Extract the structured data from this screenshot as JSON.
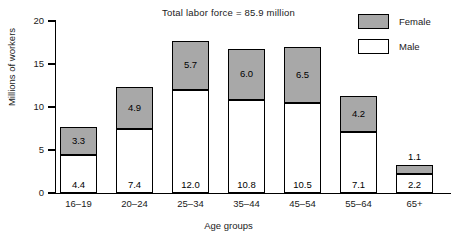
{
  "chart_data": {
    "type": "bar",
    "subtype": "stacked-bar",
    "title": "Total labor force = 85.9 million",
    "xlabel": "Age groups",
    "ylabel": "Millions of workers",
    "ylim": [
      0,
      20
    ],
    "yticks": [
      0,
      5,
      10,
      15,
      20
    ],
    "grid": false,
    "legend_position": "top-right",
    "categories": [
      "16–19",
      "20–24",
      "25–34",
      "35–44",
      "45–54",
      "55–64",
      "65+"
    ],
    "series": [
      {
        "name": "Male",
        "color": "#ffffff",
        "values": [
          4.4,
          7.4,
          12.0,
          10.8,
          10.5,
          7.1,
          2.2
        ],
        "labels": [
          "4.4",
          "7.4",
          "12.0",
          "10.8",
          "10.5",
          "7.1",
          "2.2"
        ]
      },
      {
        "name": "Female",
        "color": "#a8a8a8",
        "values": [
          3.3,
          4.9,
          5.7,
          6.0,
          6.5,
          4.2,
          1.1
        ],
        "labels": [
          "3.3",
          "4.9",
          "5.7",
          "6.0",
          "6.5",
          "4.2",
          "1.1"
        ]
      }
    ],
    "totals": [
      7.7,
      12.3,
      17.7,
      16.8,
      17.0,
      11.3,
      3.3
    ]
  },
  "axes": {
    "y_tick_labels": [
      "0",
      "5",
      "10",
      "15",
      "20"
    ],
    "y_axis_title": "Millions of workers",
    "x_axis_title": "Age groups",
    "x_tick_labels": [
      "16–19",
      "20–24",
      "25–34",
      "35–44",
      "45–54",
      "55–64",
      "65+"
    ]
  },
  "legend": {
    "items": [
      {
        "label": "Female",
        "swatch": "female-swatch"
      },
      {
        "label": "Male",
        "swatch": "male-swatch"
      }
    ]
  },
  "title": "Total labor force = 85.9 million",
  "colors": {
    "female_fill": "#a8a8a8",
    "male_fill": "#ffffff",
    "stroke": "#000000",
    "text": "#1a1a1a",
    "background": "#ffffff"
  }
}
